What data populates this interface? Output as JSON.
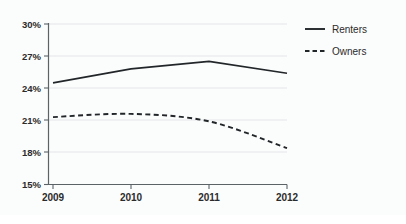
{
  "chart_data": {
    "type": "line",
    "title": "",
    "subtitle": "",
    "xlabel": "",
    "ylabel": "",
    "x": [
      "2009",
      "2010",
      "2011",
      "2012"
    ],
    "categories": [
      "2009",
      "2010",
      "2011",
      "2012"
    ],
    "series": [
      {
        "name": "Renters",
        "style": "solid",
        "color": "#222629",
        "values": [
          24.5,
          25.8,
          26.5,
          25.4
        ]
      },
      {
        "name": "Owners",
        "style": "dashed",
        "color": "#222629",
        "values": [
          21.3,
          21.6,
          20.9,
          18.4
        ]
      }
    ],
    "ylim": [
      15,
      30
    ],
    "ytick_values": [
      15,
      18,
      21,
      24,
      27,
      30
    ],
    "ytick_labels": [
      "15%",
      "18%",
      "21%",
      "24%",
      "27%",
      "30%"
    ],
    "xtick_labels": [
      "2009",
      "2010",
      "2011",
      "2012"
    ],
    "grid": true,
    "grid_axis": "y",
    "legend": true,
    "legend_position": "right-top",
    "legend_entries": [
      "Renters",
      "Owners"
    ],
    "annotations": []
  },
  "axes": {
    "y_labels": [
      "30%",
      "27%",
      "24%",
      "21%",
      "18%",
      "15%"
    ],
    "x_labels": [
      "2009",
      "2010",
      "2011",
      "2012"
    ]
  },
  "legend": {
    "items": [
      {
        "label": "Renters",
        "style": "solid"
      },
      {
        "label": "Owners",
        "style": "dashed"
      }
    ]
  },
  "colors": {
    "background": "#fbfcfc",
    "line": "#222629",
    "grid": "#e3e6e8",
    "axis": "#5b6366",
    "text": "#2b2b2b"
  }
}
